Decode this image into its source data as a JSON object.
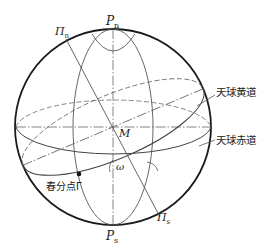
{
  "diagram": {
    "labels": {
      "north_pole": "P",
      "north_pole_sub": "n",
      "south_pole": "P",
      "south_pole_sub": "s",
      "ecliptic_north_pole": "Π",
      "ecliptic_north_pole_sub": "n",
      "ecliptic_south_pole": "Π",
      "ecliptic_south_pole_sub": "s",
      "center": "M",
      "obliquity_angle": "ω",
      "vernal_equinox": "春分点Γ",
      "ecliptic": "天球黄道",
      "equator": "天球赤道"
    },
    "colors": {
      "sphere_outline": "#1a1a1a",
      "lines": "#555555",
      "text": "#222222",
      "background": "#ffffff"
    }
  }
}
